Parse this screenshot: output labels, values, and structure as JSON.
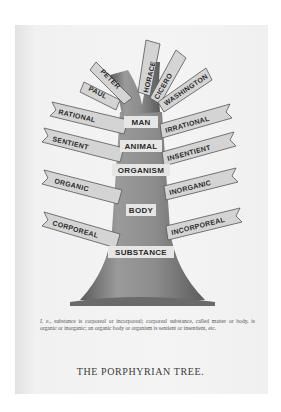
{
  "figure": {
    "title": "THE PORPHYRIAN TREE.",
    "trunk_labels": [
      "MAN",
      "ANIMAL",
      "ORGANISM",
      "BODY",
      "SUBSTANCE"
    ],
    "left_branches": [
      "RATIONAL",
      "SENTIENT",
      "ORGANIC",
      "CORPOREAL"
    ],
    "right_branches": [
      "IRRATIONAL",
      "INSENTIENT",
      "INORGANIC",
      "INCORPOREAL"
    ],
    "top_branches": [
      "PAUL",
      "PETER",
      "HORACE",
      "CICERO",
      "WASHINGTON"
    ],
    "caption_prefix": "I. e.,",
    "caption": "substance is corporeal or incorporeal; corporeal substance, called matter or body, is organic or inorganic; an organic body or organism is sentient or insentient, etc."
  },
  "colors": {
    "page": "#f2f2f2",
    "ink": "#2a2a2a",
    "trunk": "#8a8a8a",
    "banner": "#d8d8d8"
  }
}
